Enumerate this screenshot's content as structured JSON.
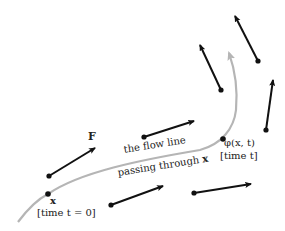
{
  "figure": {
    "type": "flow-line-diagram",
    "colors": {
      "background": "#ffffff",
      "vector_arrow": "#111111",
      "flow_line": "#b5b5b5",
      "text": "#222222"
    },
    "labels": {
      "vector_field": "F",
      "flow_line_line1": "the flow line",
      "flow_line_line2_prefix": "passing through ",
      "flow_line_line2_var": "x",
      "start_point": "x",
      "start_time": "[time t = 0]",
      "end_point": "φ(x, t)",
      "end_time": "[time t]"
    },
    "vectors": [
      {
        "name": "F",
        "tail": [
          49,
          176
        ],
        "head": [
          95,
          148
        ]
      },
      {
        "name": "v2",
        "tail": [
          144,
          137
        ],
        "head": [
          194,
          121
        ]
      },
      {
        "name": "v3",
        "tail": [
          111,
          205
        ],
        "head": [
          163,
          186
        ]
      },
      {
        "name": "v4",
        "tail": [
          194,
          193
        ],
        "head": [
          251,
          184
        ]
      },
      {
        "name": "v5",
        "tail": [
          221,
          90
        ],
        "head": [
          200,
          45
        ]
      },
      {
        "name": "v6",
        "tail": [
          258,
          61
        ],
        "head": [
          235,
          16
        ]
      },
      {
        "name": "v7",
        "tail": [
          266,
          130
        ],
        "head": [
          273,
          80
        ]
      }
    ],
    "flow_line": {
      "start": [
        18,
        222
      ],
      "through_x": [
        48,
        194
      ],
      "through_phi": [
        223,
        139
      ],
      "end_arrow": [
        229,
        53
      ]
    }
  }
}
